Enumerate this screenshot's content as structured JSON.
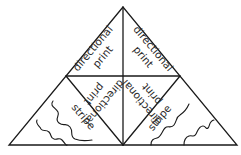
{
  "diagram": {
    "type": "triangle-tile-pattern-layout",
    "colors": {
      "line": "#1a1a1a",
      "text": "#2a2a2a",
      "background": "#ffffff"
    },
    "regions": [
      {
        "id": "top-left",
        "lines": [
          "directional",
          "print"
        ],
        "orientation": "rotated -50deg"
      },
      {
        "id": "top-right",
        "lines": [
          "directional",
          "print"
        ],
        "orientation": "rotated 50deg"
      },
      {
        "id": "center-left",
        "lines": [
          "directional",
          "print"
        ],
        "orientation": "upside-down, rotated 130deg"
      },
      {
        "id": "center-right",
        "lines": [
          "directional",
          "print"
        ],
        "orientation": "upside-down, rotated -130deg"
      },
      {
        "id": "bottom-left",
        "lines": [
          "stripe"
        ],
        "orientation": "rotated 50deg",
        "decoration": "wavy-lines"
      },
      {
        "id": "bottom-right",
        "lines": [
          "stripe"
        ],
        "orientation": "rotated -50deg",
        "decoration": "wavy-lines"
      }
    ]
  }
}
